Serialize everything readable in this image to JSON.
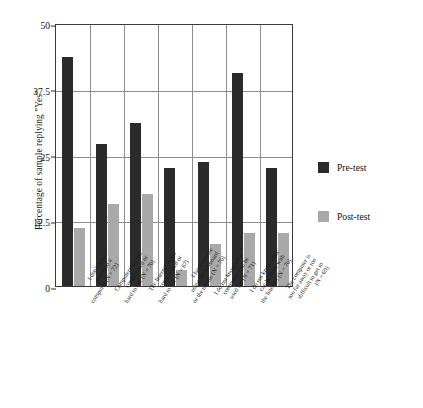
{
  "chart_data": {
    "type": "bar",
    "title": "",
    "xlabel": "",
    "ylabel": "Percentage of sample replying \"Yes\"",
    "ylim": [
      0,
      50
    ],
    "yticks": [
      "0",
      "12.5",
      "25",
      "37.5",
      "50"
    ],
    "ytick_values": [
      0,
      12.5,
      25,
      37.5,
      50
    ],
    "grid": "horizontal-and-vertical",
    "legend_position": "right",
    "categories": [
      "I don't have access to a computer (N = 72)",
      "Computers are too complicated or hard to use (N = 70)",
      "The Internet is too complicated or hard to use (N = 67)",
      "I have trouble using the keyboard or the mouse (N = 70)",
      "I do not know what computers can be used for (N = 71)",
      "I do not know what can be done with the Internet (N = 70)",
      "The computer is too far away or too difficult to get to (N = 69)"
    ],
    "category_lines": [
      [
        "I don't have",
        "access to a",
        "computer (N = 72)"
      ],
      [
        "Computers are too",
        "complicated or",
        "hard to use (N = 70)"
      ],
      [
        "The Internet is too",
        "complicated or",
        "hard to use (N = 67)"
      ],
      [
        "I have trouble",
        "using the keyboard",
        "or the mouse (N = 70)"
      ],
      [
        "I do not know what",
        "computers can be",
        "used for (N = 71)"
      ],
      [
        "I do not know what",
        "can be done with",
        "the Internet (N = 70)"
      ],
      [
        "The computer is",
        "too far away or too",
        "difficult to get to",
        "(N = 69)"
      ]
    ],
    "series": [
      {
        "name": "Pre-test",
        "color": "#2b2b2b",
        "values": [
          43.5,
          27.0,
          31.0,
          22.5,
          23.5,
          40.5,
          22.5
        ]
      },
      {
        "name": "Post-test",
        "color": "#a9a9a9",
        "values": [
          11.0,
          15.5,
          17.5,
          3.0,
          8.0,
          10.0,
          10.0
        ]
      }
    ]
  },
  "legend": {
    "items": [
      {
        "label": "Pre-test",
        "color": "#2b2b2b"
      },
      {
        "label": "Post-test",
        "color": "#a9a9a9"
      }
    ]
  }
}
